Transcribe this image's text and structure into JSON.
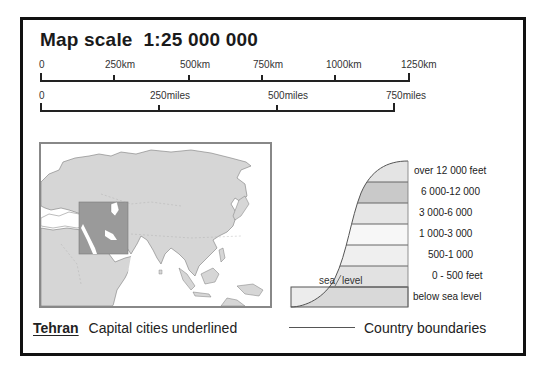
{
  "title": "Map scale  1:25 000 000",
  "scale_km": {
    "ticks": [
      {
        "label": "0",
        "x": 40
      },
      {
        "label": "250km",
        "x": 113
      },
      {
        "label": "500km",
        "x": 188
      },
      {
        "label": "750km",
        "x": 261
      },
      {
        "label": "1000km",
        "x": 334
      },
      {
        "label": "1250km",
        "x": 409
      }
    ]
  },
  "scale_miles": {
    "ticks": [
      {
        "label": "0",
        "x": 40
      },
      {
        "label": "250miles",
        "x": 158
      },
      {
        "label": "500miles",
        "x": 276
      },
      {
        "label": "750miles",
        "x": 394
      }
    ]
  },
  "inset_map": {
    "label": "Locator map of Asia with highlighted region (Middle East)",
    "land_color": "#d6d6d6",
    "highlight_color": "#9a9a9a",
    "sea_color": "#ffffff"
  },
  "elevation_key": {
    "bands": [
      {
        "label": "over 12 000 feet",
        "color": "#e4e4e4"
      },
      {
        "label": "6 000-12 000",
        "color": "#c9c9c9"
      },
      {
        "label": "3 000-6 000",
        "color": "#e6e6e6"
      },
      {
        "label": "1 000-3 000",
        "color": "#f7f7f7"
      },
      {
        "label": "500-1 000",
        "color": "#efefef"
      },
      {
        "label": "0 - 500 feet",
        "color": "#e2e2e2"
      },
      {
        "label": "below sea level",
        "color": "#d9d9d9"
      }
    ],
    "sea_label": "sea",
    "level_label": "level"
  },
  "legend": {
    "capital_example": "Tehran",
    "capital_text": "Capital cities underlined",
    "boundary_text": "Country boundaries"
  }
}
